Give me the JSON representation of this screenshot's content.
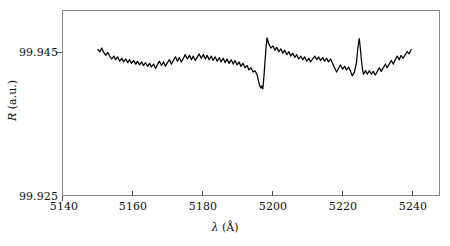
{
  "figure": {
    "background": "#ffffff",
    "frame_color": "#8a8a8a",
    "trace_color": "#000000"
  },
  "axes": {
    "x_title_symbol": "λ",
    "x_title_unit": "(Å)",
    "y_title_symbol": "R",
    "y_title_unit": "(a.u.)",
    "x_ticks": [
      "5140",
      "5160",
      "5180",
      "5200",
      "5220",
      "5240"
    ],
    "y_ticks": [
      "99.945",
      "99.925"
    ]
  },
  "chart_data": {
    "type": "line",
    "title": "",
    "xlabel": "λ (Å)",
    "ylabel": "R (a.u.)",
    "xlim": [
      5140,
      5248
    ],
    "ylim": [
      99.925,
      99.9503
    ],
    "grid": false,
    "legend": null,
    "xtick_values": [
      5140,
      5160,
      5180,
      5200,
      5220,
      5240
    ],
    "ytick_values": [
      99.945,
      99.925
    ],
    "annotations": [
      {
        "label": "dispersive resonance dip",
        "x": 5196.5,
        "y": 99.9395
      },
      {
        "label": "dispersive resonance peak",
        "x": 5197.5,
        "y": 99.9466
      },
      {
        "label": "narrow spike",
        "x": 5225.0,
        "y": 99.9465
      }
    ],
    "series": [
      {
        "name": "Reflectance spectrum",
        "color": "#000000",
        "x": [
          5150.0,
          5150.6,
          5151.1,
          5151.7,
          5152.3,
          5152.9,
          5153.4,
          5154.0,
          5154.6,
          5155.1,
          5155.7,
          5156.3,
          5156.9,
          5157.4,
          5158.0,
          5158.6,
          5159.1,
          5159.7,
          5160.3,
          5160.9,
          5161.4,
          5162.0,
          5162.6,
          5163.1,
          5163.7,
          5164.3,
          5164.9,
          5165.4,
          5166.0,
          5166.6,
          5167.1,
          5167.7,
          5168.3,
          5168.9,
          5169.4,
          5170.0,
          5170.6,
          5171.1,
          5171.7,
          5172.3,
          5172.9,
          5173.4,
          5174.0,
          5174.6,
          5175.1,
          5175.7,
          5176.3,
          5176.9,
          5177.4,
          5178.0,
          5178.6,
          5179.1,
          5179.7,
          5180.3,
          5180.9,
          5181.4,
          5182.0,
          5182.6,
          5183.1,
          5183.7,
          5184.3,
          5184.9,
          5185.4,
          5186.0,
          5186.6,
          5187.1,
          5187.7,
          5188.3,
          5188.9,
          5189.4,
          5190.0,
          5190.6,
          5191.1,
          5191.7,
          5192.3,
          5192.9,
          5193.4,
          5194.0,
          5194.6,
          5195.1,
          5195.7,
          5196.0,
          5196.3,
          5196.6,
          5196.9,
          5197.1,
          5197.4,
          5197.7,
          5198.0,
          5198.3,
          5198.6,
          5199.1,
          5199.7,
          5200.3,
          5200.9,
          5201.4,
          5202.0,
          5202.6,
          5203.1,
          5203.7,
          5204.3,
          5204.9,
          5205.4,
          5206.0,
          5206.6,
          5207.1,
          5207.7,
          5208.3,
          5208.9,
          5209.4,
          5210.0,
          5210.6,
          5211.1,
          5211.7,
          5212.3,
          5212.9,
          5213.4,
          5214.0,
          5214.6,
          5215.1,
          5215.7,
          5216.3,
          5216.9,
          5217.4,
          5218.0,
          5218.6,
          5219.1,
          5219.7,
          5220.3,
          5220.9,
          5221.4,
          5222.0,
          5222.6,
          5223.1,
          5223.7,
          5224.3,
          5224.6,
          5224.9,
          5225.1,
          5225.4,
          5225.7,
          5226.0,
          5226.3,
          5226.9,
          5227.4,
          5228.0,
          5228.6,
          5229.1,
          5229.7,
          5230.3,
          5230.9,
          5231.4,
          5232.0,
          5232.6,
          5233.1,
          5233.7,
          5234.3,
          5234.9,
          5235.4,
          5236.0,
          5236.6,
          5237.1,
          5237.7,
          5238.3,
          5238.9,
          5239.4,
          5240.0
        ],
        "y": [
          99.945,
          99.9447,
          99.9452,
          99.9446,
          99.9442,
          99.9446,
          99.9441,
          99.9437,
          99.9441,
          99.9436,
          99.944,
          99.9434,
          99.9438,
          99.9433,
          99.9437,
          99.9432,
          99.9436,
          99.9431,
          99.9435,
          99.943,
          99.9434,
          99.9429,
          99.9433,
          99.9428,
          99.9432,
          99.9427,
          99.9431,
          99.9426,
          99.943,
          99.9424,
          99.9429,
          99.9434,
          99.9428,
          99.9433,
          99.9427,
          99.9432,
          99.9436,
          99.943,
          99.9435,
          99.944,
          99.9434,
          99.9439,
          99.9433,
          99.9438,
          99.9443,
          99.9437,
          99.9442,
          99.9436,
          99.9441,
          99.9435,
          99.944,
          99.9444,
          99.9438,
          99.9443,
          99.9437,
          99.9442,
          99.9436,
          99.9441,
          99.9435,
          99.944,
          99.9434,
          99.9439,
          99.9433,
          99.9438,
          99.9432,
          99.9437,
          99.9431,
          99.9436,
          99.943,
          99.9435,
          99.9429,
          99.9433,
          99.9427,
          99.9431,
          99.9425,
          99.9428,
          99.9422,
          99.9425,
          99.9419,
          99.9421,
          99.9416,
          99.941,
          99.9404,
          99.9399,
          99.9397,
          99.94,
          99.9396,
          99.9412,
          99.9432,
          99.9452,
          99.9466,
          99.9458,
          99.9452,
          99.9455,
          99.9449,
          99.9453,
          99.9447,
          99.9451,
          99.9445,
          99.9449,
          99.9443,
          99.9447,
          99.9441,
          99.9445,
          99.9439,
          99.9443,
          99.9437,
          99.9441,
          99.9436,
          99.944,
          99.9434,
          99.9438,
          99.9433,
          99.9437,
          99.9441,
          99.9436,
          99.944,
          99.9435,
          99.9439,
          99.9434,
          99.9438,
          99.9433,
          99.9437,
          99.9431,
          99.9425,
          99.9419,
          99.9424,
          99.9429,
          99.9423,
          99.9427,
          99.9422,
          99.9426,
          99.942,
          99.9414,
          99.9419,
          99.9432,
          99.9448,
          99.946,
          99.9465,
          99.9452,
          99.9436,
          99.9424,
          99.9416,
          99.9421,
          99.9416,
          99.9421,
          99.9416,
          99.942,
          99.9415,
          99.942,
          99.9425,
          99.942,
          99.9425,
          99.943,
          99.9425,
          99.943,
          99.9435,
          99.943,
          99.9436,
          99.9441,
          99.9436,
          99.9442,
          99.9438,
          99.9443,
          99.9447,
          99.9444,
          99.945
        ]
      }
    ]
  }
}
